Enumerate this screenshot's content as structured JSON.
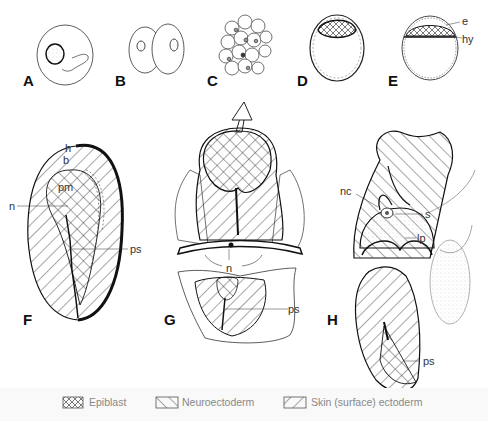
{
  "figure": {
    "panels": [
      {
        "id": "A",
        "label": "A"
      },
      {
        "id": "B",
        "label": "B"
      },
      {
        "id": "C",
        "label": "C"
      },
      {
        "id": "D",
        "label": "D"
      },
      {
        "id": "E",
        "label": "E",
        "annotations": [
          "e",
          "hy"
        ]
      },
      {
        "id": "F",
        "label": "F",
        "annotations": [
          "h",
          "b",
          "pm",
          "n",
          "ps"
        ]
      },
      {
        "id": "G",
        "label": "G",
        "annotations": [
          "n",
          "ps"
        ]
      },
      {
        "id": "H",
        "label": "H",
        "annotations": [
          "nc",
          "s",
          "lp",
          "ps"
        ]
      }
    ],
    "annotations": {
      "E": {
        "e": "e",
        "hy": "hy"
      },
      "F": {
        "h": "h",
        "b": "b",
        "pm": "pm",
        "n": "n",
        "ps": "ps"
      },
      "G": {
        "n": "n",
        "ps": "ps"
      },
      "H": {
        "nc": "nc",
        "s": "s",
        "lp": "lp",
        "ps": "ps"
      }
    },
    "legend": [
      {
        "pattern": "crosshatch",
        "label": "Epiblast"
      },
      {
        "pattern": "forward-hatch",
        "label": "Neuroectoderm"
      },
      {
        "pattern": "back-hatch",
        "label": "Skin (surface) ectoderm"
      }
    ],
    "colors": {
      "line": "#1a1a1a",
      "label": "#111111",
      "legend_text": "#888888",
      "background": "#ffffff"
    }
  }
}
